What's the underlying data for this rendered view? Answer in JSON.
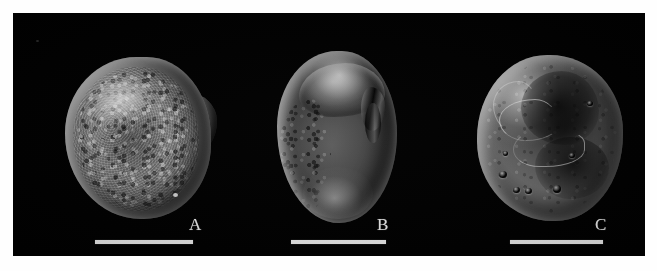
{
  "figure": {
    "type": "sem-micrograph-plate",
    "background_color": "#ffffff",
    "plate_color": "#000000",
    "panel_count": 3,
    "panels": [
      {
        "id": "a",
        "label": "A",
        "specimen_description": "rounded grain with coarse granular (verrucate) surface and a lobed notch on the right margin",
        "scale_bar_present": true
      },
      {
        "id": "b",
        "label": "B",
        "specimen_description": "elongate oval grain, smooth domed upper fold, pitted (foveolate) left flank, dark aperture notch on right margin",
        "scale_bar_present": true
      },
      {
        "id": "c",
        "label": "C",
        "specimen_description": "rounded grain with sinuous bright ridges, dark depressions and scattered round pits near the lower margin",
        "scale_bar_present": true
      }
    ],
    "scale_bars": [
      {
        "panel": "A",
        "label": ""
      },
      {
        "panel": "B",
        "label": ""
      },
      {
        "panel": "C",
        "label": ""
      }
    ],
    "label_color": "#f2f2f2",
    "scale_bar_color": "#f4f4f4"
  }
}
